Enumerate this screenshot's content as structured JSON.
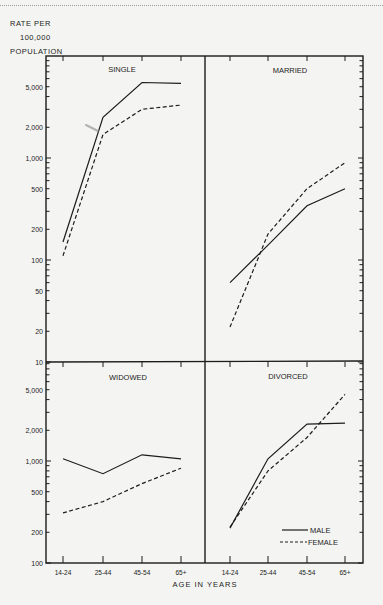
{
  "y_axis_label": [
    "RATE  PER",
    "100,000",
    "POPULATION"
  ],
  "x_axis_title": "AGE IN YEARS",
  "legend": {
    "male": "MALE",
    "female": "FEMALE"
  },
  "colors": {
    "ink": "#1c1c1c",
    "background": "#f4f4f2"
  },
  "chart_data": {
    "type": "line",
    "title": "",
    "xlabel": "AGE IN YEARS",
    "ylabel": "RATE PER 100,000 POPULATION",
    "yscale": "log",
    "categories": [
      "14-24",
      "25-44",
      "45-54",
      "65+"
    ],
    "legend_position": "inside lower-right of DIVORCED panel",
    "grid": false,
    "panels": [
      {
        "name": "SINGLE",
        "ylim": [
          10,
          10000
        ],
        "yticks": [
          "5,000",
          "2,000",
          "1,000",
          "500",
          "200",
          "100",
          "50",
          "20",
          "10"
        ],
        "series": [
          {
            "name": "MALE",
            "style": "solid",
            "values": [
              150,
              2500,
              5500,
              5400
            ]
          },
          {
            "name": "FEMALE",
            "style": "dashed",
            "values": [
              110,
              1700,
              3000,
              3300
            ]
          }
        ]
      },
      {
        "name": "MARRIED",
        "ylim": [
          10,
          10000
        ],
        "series": [
          {
            "name": "MALE",
            "style": "solid",
            "values": [
              60,
              140,
              340,
              500
            ]
          },
          {
            "name": "FEMALE",
            "style": "dashed",
            "values": [
              22,
              180,
              500,
              900
            ]
          }
        ]
      },
      {
        "name": "WIDOWED",
        "ylim": [
          100,
          10000
        ],
        "yticks": [
          "5,000",
          "2,000",
          "1,000",
          "500",
          "200",
          "100"
        ],
        "series": [
          {
            "name": "MALE",
            "style": "solid",
            "values": [
              1050,
              750,
              1150,
              1050
            ]
          },
          {
            "name": "FEMALE",
            "style": "dashed",
            "values": [
              310,
              400,
              600,
              850
            ]
          }
        ]
      },
      {
        "name": "DIVORCED",
        "ylim": [
          100,
          10000
        ],
        "series": [
          {
            "name": "MALE",
            "style": "solid",
            "values": [
              220,
              1050,
              2300,
              2350
            ]
          },
          {
            "name": "FEMALE",
            "style": "dashed",
            "values": [
              225,
              800,
              1700,
              4500
            ]
          }
        ]
      }
    ]
  }
}
